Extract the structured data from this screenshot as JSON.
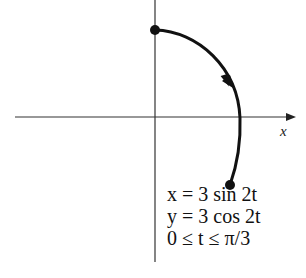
{
  "diagram": {
    "type": "parametric-curve",
    "axes": {
      "x_label": "x"
    },
    "equations": [
      "x = 3 sin 2t",
      "y = 3 cos 2t",
      "0 ≤ t ≤ π/3"
    ],
    "curve": {
      "description": "arc of circle of radius 3 traced clockwise from (0,3)",
      "start_point": [
        0,
        3
      ],
      "end_point": [
        2.598,
        -1.5
      ],
      "direction": "clockwise"
    },
    "colors": {
      "ink": "#111111",
      "axis": "#333333",
      "background": "#ffffff"
    }
  }
}
